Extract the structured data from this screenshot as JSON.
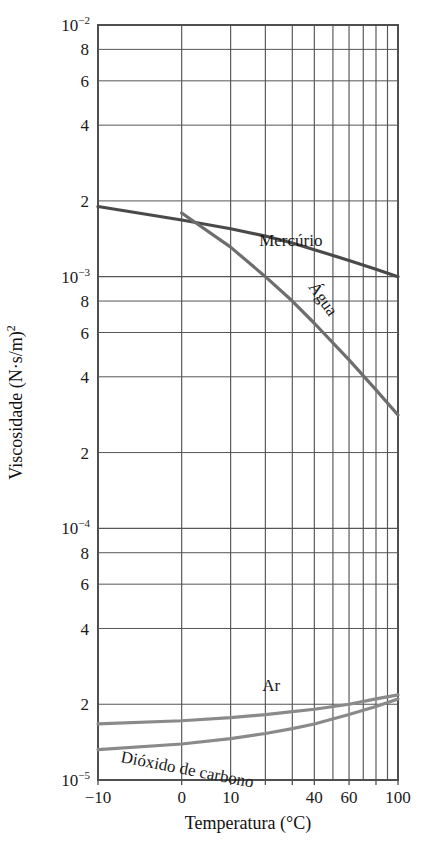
{
  "chart_data": {
    "type": "line",
    "title": "",
    "xlabel": "Temperatura (°C)",
    "ylabel": "Viscosidade (N·s/m)",
    "ylabel_exponent": "2",
    "scale": {
      "x": "log-like",
      "y": "log"
    },
    "grid": true,
    "legend_position": "inline-labels",
    "xlim": [
      -10,
      100
    ],
    "ylim": [
      1e-05,
      0.01
    ],
    "xticks": [
      -10,
      0,
      10,
      20,
      30,
      40,
      60,
      80,
      100
    ],
    "xtick_labels": [
      "−10",
      "0",
      "10",
      "",
      "",
      "40",
      "60",
      "",
      "100"
    ],
    "yticks": [
      {
        "value": 0.01,
        "label": "10",
        "sup": "−2"
      },
      {
        "value": 0.008,
        "label": "8",
        "sup": ""
      },
      {
        "value": 0.006,
        "label": "6",
        "sup": ""
      },
      {
        "value": 0.004,
        "label": "4",
        "sup": ""
      },
      {
        "value": 0.002,
        "label": "2",
        "sup": ""
      },
      {
        "value": 0.001,
        "label": "10",
        "sup": "−3"
      },
      {
        "value": 0.0008,
        "label": "8",
        "sup": ""
      },
      {
        "value": 0.0006,
        "label": "6",
        "sup": ""
      },
      {
        "value": 0.0004,
        "label": "4",
        "sup": ""
      },
      {
        "value": 0.0002,
        "label": "2",
        "sup": ""
      },
      {
        "value": 0.0001,
        "label": "10",
        "sup": "−4"
      },
      {
        "value": 8e-05,
        "label": "8",
        "sup": ""
      },
      {
        "value": 6e-05,
        "label": "6",
        "sup": ""
      },
      {
        "value": 4e-05,
        "label": "4",
        "sup": ""
      },
      {
        "value": 2e-05,
        "label": "2",
        "sup": ""
      },
      {
        "value": 1e-05,
        "label": "10",
        "sup": "−5"
      }
    ],
    "series": [
      {
        "name": "Mercúrio",
        "label": "Mercúrio",
        "color": "#4a4a4a",
        "label_rotation": 0,
        "points": [
          {
            "x": -10,
            "y": 0.0019
          },
          {
            "x": 0,
            "y": 0.00168
          },
          {
            "x": 10,
            "y": 0.00155
          },
          {
            "x": 20,
            "y": 0.00145
          },
          {
            "x": 30,
            "y": 0.00136
          },
          {
            "x": 40,
            "y": 0.00128
          },
          {
            "x": 60,
            "y": 0.00116
          },
          {
            "x": 80,
            "y": 0.00107
          },
          {
            "x": 100,
            "y": 0.001
          }
        ]
      },
      {
        "name": "Água",
        "label": "Água",
        "color": "#6e6e6e",
        "label_rotation": 55,
        "points": [
          {
            "x": 0,
            "y": 0.00179
          },
          {
            "x": 10,
            "y": 0.00131
          },
          {
            "x": 20,
            "y": 0.001
          },
          {
            "x": 30,
            "y": 0.0008
          },
          {
            "x": 40,
            "y": 0.000653
          },
          {
            "x": 60,
            "y": 0.000467
          },
          {
            "x": 80,
            "y": 0.000355
          },
          {
            "x": 100,
            "y": 0.000282
          }
        ]
      },
      {
        "name": "Ar",
        "label": "Ar",
        "color": "#8a8a8a",
        "label_rotation": 0,
        "points": [
          {
            "x": -10,
            "y": 1.67e-05
          },
          {
            "x": 0,
            "y": 1.72e-05
          },
          {
            "x": 10,
            "y": 1.77e-05
          },
          {
            "x": 20,
            "y": 1.82e-05
          },
          {
            "x": 30,
            "y": 1.87e-05
          },
          {
            "x": 40,
            "y": 1.91e-05
          },
          {
            "x": 60,
            "y": 2e-05
          },
          {
            "x": 80,
            "y": 2.1e-05
          },
          {
            "x": 100,
            "y": 2.18e-05
          }
        ]
      },
      {
        "name": "Dióxido de carbono",
        "label": "Dióxido de carbono",
        "color": "#8a8a8a",
        "label_rotation": 11,
        "points": [
          {
            "x": -10,
            "y": 1.32e-05
          },
          {
            "x": 0,
            "y": 1.39e-05
          },
          {
            "x": 10,
            "y": 1.46e-05
          },
          {
            "x": 20,
            "y": 1.53e-05
          },
          {
            "x": 30,
            "y": 1.6e-05
          },
          {
            "x": 40,
            "y": 1.67e-05
          },
          {
            "x": 60,
            "y": 1.82e-05
          },
          {
            "x": 80,
            "y": 1.96e-05
          },
          {
            "x": 100,
            "y": 2.1e-05
          }
        ]
      }
    ],
    "colors": {
      "grid": "#555555",
      "frame": "#4f4f4f",
      "background": "#ffffff",
      "text": "#1a1a1a"
    }
  }
}
